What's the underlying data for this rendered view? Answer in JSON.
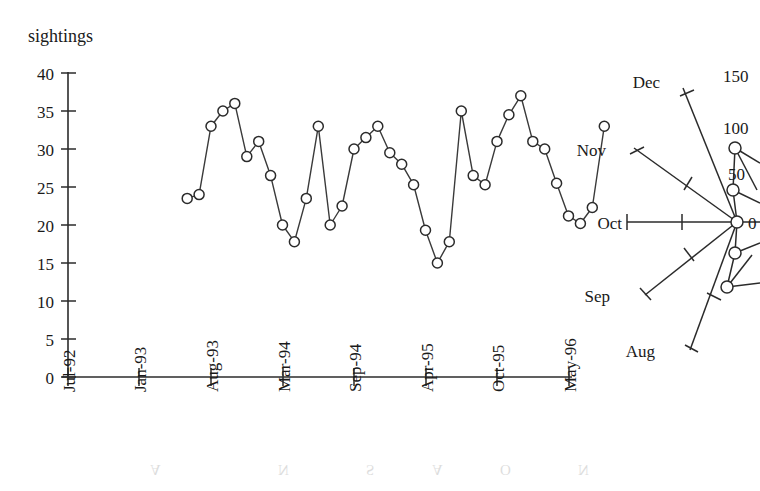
{
  "figure": {
    "background": "#ffffff",
    "ink_color": "#2b2b2b",
    "y_axis_title": "sightings"
  },
  "chart_data": [
    {
      "id": "sightings-timeseries",
      "type": "line",
      "title": "",
      "subtitle": "",
      "xlabel": "",
      "ylabel": "sightings",
      "ylim": [
        0,
        40
      ],
      "ytick_labels": [
        "0",
        "5",
        "10",
        "15",
        "20",
        "25",
        "30",
        "35",
        "40"
      ],
      "ytick_values": [
        0,
        5,
        10,
        15,
        20,
        25,
        30,
        35,
        40
      ],
      "xtick_labels": [
        "Jul-92",
        "Jan-93",
        "Aug-93",
        "Mar-94",
        "Sep-94",
        "Apr-95",
        "Oct-95",
        "May-96"
      ],
      "xtick_values": [
        0,
        6,
        13,
        20,
        26,
        33,
        39,
        46
      ],
      "grid": false,
      "legend": "none",
      "marker": "open-circle",
      "x": [
        10,
        11,
        12,
        13,
        14,
        15,
        16,
        17,
        18,
        19,
        20,
        21,
        22,
        23,
        24,
        25,
        26,
        27,
        28,
        29,
        30,
        31,
        32,
        33,
        34,
        35,
        36,
        37,
        38,
        39,
        40
      ],
      "values": [
        23.5,
        24.0,
        33.0,
        35.0,
        36.0,
        29.0,
        31.0,
        26.5,
        20.0,
        17.8,
        23.5,
        33.0,
        20.0,
        22.5,
        30.0,
        31.5,
        33.0,
        29.5,
        28.0,
        25.3,
        19.3,
        15.0,
        17.8,
        35.0,
        26.5,
        25.3,
        31.0,
        34.5,
        37.0,
        31.0,
        30.0
      ],
      "values_tail": [
        25.5,
        21.2,
        20.2,
        22.3,
        33.0
      ]
    },
    {
      "id": "monthly-polar",
      "type": "polar",
      "note": "partial radial plot, clipped at right image edge",
      "angular_labels": [
        "Dec",
        "Nov",
        "Oct",
        "Sep",
        "Aug"
      ],
      "radial_tick_labels": [
        "0",
        "50",
        "100",
        "150"
      ],
      "radial_tick_values": [
        0,
        50,
        100,
        150
      ],
      "rlim": [
        0,
        150
      ]
    }
  ],
  "timeseries": {
    "y_ticks": [
      {
        "label": "40",
        "value": 40
      },
      {
        "label": "35",
        "value": 35
      },
      {
        "label": "30",
        "value": 30
      },
      {
        "label": "25",
        "value": 25
      },
      {
        "label": "20",
        "value": 20
      },
      {
        "label": "15",
        "value": 15
      },
      {
        "label": "10",
        "value": 10
      },
      {
        "label": "5",
        "value": 5
      },
      {
        "label": "0",
        "value": 0
      }
    ],
    "x_ticks": [
      {
        "label": "Jul-92"
      },
      {
        "label": "Jan-93"
      },
      {
        "label": "Aug-93"
      },
      {
        "label": "Mar-94"
      },
      {
        "label": "Sep-94"
      },
      {
        "label": "Apr-95"
      },
      {
        "label": "Oct-95"
      },
      {
        "label": "May-96"
      }
    ]
  },
  "polar": {
    "month_labels": [
      {
        "label": "Dec"
      },
      {
        "label": "Nov"
      },
      {
        "label": "Oct"
      },
      {
        "label": "Sep"
      },
      {
        "label": "Aug"
      }
    ],
    "radial_labels": [
      {
        "label": "150"
      },
      {
        "label": "100"
      },
      {
        "label": "50"
      },
      {
        "label": "0"
      }
    ]
  },
  "bleedthrough": {
    "glyphs": [
      "A",
      "N",
      "S",
      "A",
      "O",
      "N"
    ]
  }
}
